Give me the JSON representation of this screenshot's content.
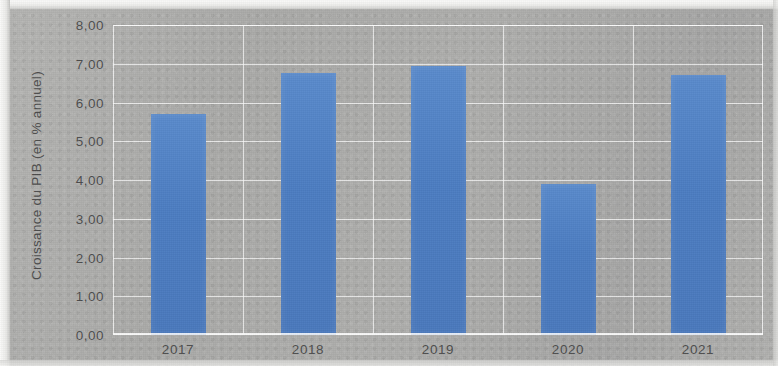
{
  "chart_data": {
    "type": "bar",
    "title": "",
    "subtitle": "",
    "xlabel": "",
    "ylabel": "Croissance du PIB (en % annuel)",
    "categories": [
      "2017",
      "2018",
      "2019",
      "2020",
      "2021"
    ],
    "values": [
      5.7,
      6.75,
      6.95,
      3.9,
      6.7
    ],
    "series": [
      {
        "name": "Croissance du PIB",
        "values": [
          5.7,
          6.75,
          6.95,
          3.9,
          6.7
        ]
      }
    ],
    "ylim": [
      0,
      8
    ],
    "ytick_step": 1,
    "ytick_labels": [
      "0,00",
      "1,00",
      "2,00",
      "3,00",
      "4,00",
      "5,00",
      "6,00",
      "7,00",
      "8,00"
    ],
    "ytick_values": [
      0,
      1,
      2,
      3,
      4,
      5,
      6,
      7,
      8
    ],
    "grid": true,
    "grid_color": "#ffffff",
    "legend": false,
    "legend_position": "none",
    "bar_color": "#4c7dc2",
    "plot_background": "#aaaaa8",
    "axis_text_color": "#4d4d4d",
    "decimal_separator": ","
  }
}
